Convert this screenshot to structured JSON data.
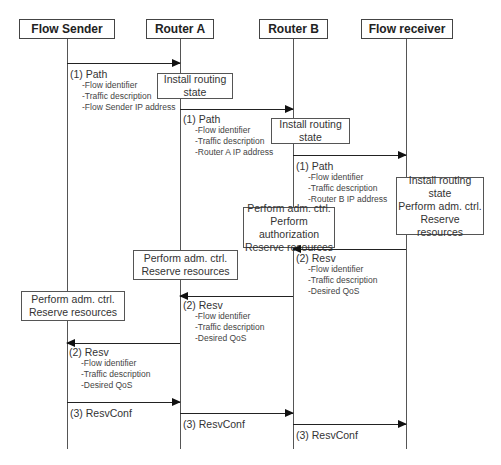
{
  "participants": [
    {
      "label": "Flow Sender"
    },
    {
      "label": "Router A"
    },
    {
      "label": "Router B"
    },
    {
      "label": "Flow receiver"
    }
  ],
  "boxes": [
    {
      "lines": [
        "Install routing",
        "state"
      ]
    },
    {
      "lines": [
        "Install routing",
        "state"
      ]
    },
    {
      "lines": [
        "Install routing state",
        "Perform adm. ctrl.",
        "Reserve resources"
      ]
    },
    {
      "lines": [
        "Perform adm. ctrl.",
        "Perform authorization",
        "Reserve resources"
      ]
    },
    {
      "lines": [
        "Perform adm. ctrl.",
        "Reserve resources"
      ]
    },
    {
      "lines": [
        "Perform adm. ctrl.",
        "Reserve resources"
      ]
    }
  ],
  "messages": [
    {
      "title": "(1) Path",
      "items": [
        "-Flow identifier",
        "-Traffic description",
        "-Flow Sender IP address"
      ]
    },
    {
      "title": "(1) Path",
      "items": [
        "-Flow identifier",
        "-Traffic description",
        "-Router A IP address"
      ]
    },
    {
      "title": "(1) Path",
      "items": [
        "-Flow identifier",
        "-Traffic description",
        "-Router B IP address"
      ]
    },
    {
      "title": "(2) Resv",
      "items": [
        "-Flow identifier",
        "-Traffic description",
        "-Desired QoS"
      ]
    },
    {
      "title": "(2) Resv",
      "items": [
        "-Flow identifier",
        "-Traffic description",
        "-Desired QoS"
      ]
    },
    {
      "title": "(2) Resv",
      "items": [
        "-Flow identifier",
        "-Traffic description",
        "-Desired QoS"
      ]
    },
    {
      "title": "(3) ResvConf",
      "items": []
    },
    {
      "title": "(3) ResvConf",
      "items": []
    },
    {
      "title": "(3) ResvConf",
      "items": []
    }
  ],
  "caption": ""
}
